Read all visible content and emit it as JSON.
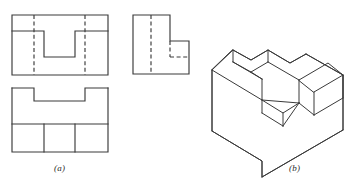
{
  "figure": {
    "background_color": "#ffffff",
    "line_color": "#3a3a3a",
    "captions": [
      {
        "id": "a",
        "label": "(a)",
        "describes": "multiview orthographic projection"
      },
      {
        "id": "b",
        "label": "(b)",
        "describes": "isometric pictorial view"
      }
    ],
    "panels": [
      {
        "name": "top-view",
        "label": "(a)",
        "projection": "top",
        "outline": [
          [
            12,
            15
          ],
          [
            108,
            15
          ],
          [
            108,
            75
          ],
          [
            12,
            75
          ]
        ],
        "edges": [
          {
            "type": "visible",
            "points": [
              [
                12,
                31
              ],
              [
                44,
                31
              ]
            ]
          },
          {
            "type": "visible",
            "points": [
              [
                44,
                31
              ],
              [
                44,
                57
              ]
            ]
          },
          {
            "type": "visible",
            "points": [
              [
                44,
                57
              ],
              [
                75,
                57
              ]
            ]
          },
          {
            "type": "visible",
            "points": [
              [
                75,
                57
              ],
              [
                75,
                31
              ]
            ]
          },
          {
            "type": "visible",
            "points": [
              [
                75,
                31
              ],
              [
                108,
                31
              ]
            ]
          }
        ],
        "hidden_edges": [
          {
            "type": "hidden",
            "points": [
              [
                34,
                15
              ],
              [
                34,
                75
              ]
            ]
          },
          {
            "type": "hidden",
            "points": [
              [
                85,
                15
              ],
              [
                85,
                75
              ]
            ]
          }
        ]
      },
      {
        "name": "front-view",
        "label": "(a)",
        "projection": "front",
        "outline": [
          [
            12,
            88
          ],
          [
            108,
            88
          ],
          [
            108,
            152
          ],
          [
            12,
            152
          ]
        ],
        "edges": [
          {
            "type": "visible",
            "points": [
              [
                12,
                88
              ],
              [
                34,
                88
              ]
            ]
          },
          {
            "type": "visible",
            "points": [
              [
                34,
                88
              ],
              [
                34,
                101
              ]
            ]
          },
          {
            "type": "visible",
            "points": [
              [
                34,
                101
              ],
              [
                85,
                101
              ]
            ]
          },
          {
            "type": "visible",
            "points": [
              [
                85,
                101
              ],
              [
                85,
                88
              ]
            ]
          },
          {
            "type": "visible",
            "points": [
              [
                85,
                88
              ],
              [
                108,
                88
              ]
            ]
          },
          {
            "type": "visible",
            "points": [
              [
                12,
                124
              ],
              [
                108,
                124
              ]
            ]
          },
          {
            "type": "visible",
            "points": [
              [
                44,
                124
              ],
              [
                44,
                152
              ]
            ]
          },
          {
            "type": "visible",
            "points": [
              [
                75,
                124
              ],
              [
                75,
                152
              ]
            ]
          }
        ],
        "hidden_edges": []
      },
      {
        "name": "side-view",
        "label": "(a)",
        "projection": "right-side",
        "outline": [
          [
            133,
            15
          ],
          [
            170,
            15
          ],
          [
            170,
            41
          ],
          [
            189,
            41
          ],
          [
            189,
            74
          ],
          [
            133,
            74
          ]
        ],
        "edges": [],
        "hidden_edges": [
          {
            "type": "hidden",
            "points": [
              [
                151,
                15
              ],
              [
                151,
                74
              ]
            ]
          },
          {
            "type": "hidden",
            "points": [
              [
                170,
                41
              ],
              [
                170,
                57
              ]
            ]
          },
          {
            "type": "hidden",
            "points": [
              [
                170,
                57
              ],
              [
                189,
                57
              ]
            ]
          }
        ]
      },
      {
        "name": "isometric-view",
        "label": "(b)",
        "projection": "isometric",
        "description": "Rectangular block with a U-shaped slot cut through the top and a rectangular notch cut in the near-right face"
      }
    ]
  }
}
